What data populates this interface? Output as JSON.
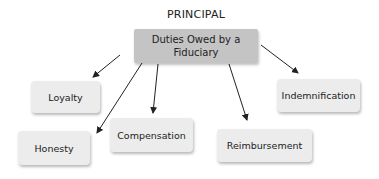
{
  "diagram": {
    "title": "PRINCIPAL",
    "root": {
      "label": "Duties Owed by a\nFiduciary",
      "line1": "Duties Owed by a",
      "line2": "Fiduciary"
    },
    "children": [
      {
        "id": "loyalty",
        "label": "Loyalty"
      },
      {
        "id": "honesty",
        "label": "Honesty"
      },
      {
        "id": "compensation",
        "label": "Compensation"
      },
      {
        "id": "reimbursement",
        "label": "Reimbursement"
      },
      {
        "id": "indemnification",
        "label": "Indemnification"
      }
    ],
    "edges": [
      {
        "from": "root",
        "to": "loyalty"
      },
      {
        "from": "root",
        "to": "honesty"
      },
      {
        "from": "root",
        "to": "compensation"
      },
      {
        "from": "root",
        "to": "reimbursement"
      },
      {
        "from": "root",
        "to": "indemnification"
      }
    ],
    "colors": {
      "root_fill": "#c4c4c4",
      "child_fill": "#ececec",
      "arrow": "#222222",
      "text": "#222222"
    }
  }
}
